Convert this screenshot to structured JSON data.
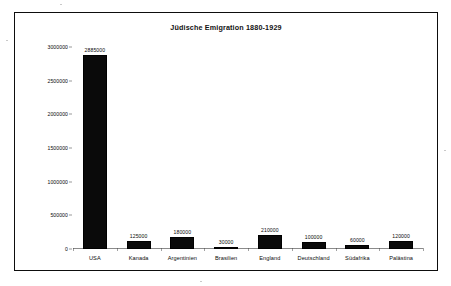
{
  "document": {
    "background_color": "#ffffff",
    "frame_color": "#0d0d0d"
  },
  "chart_data": {
    "type": "bar",
    "title": "Jüdische Emigration 1880-1929",
    "xlabel": "",
    "ylabel": "",
    "ylim": [
      0,
      3000000
    ],
    "grid": false,
    "legend": null,
    "bar_color": "#0a0a0a",
    "yticks": [
      0,
      500000,
      1000000,
      1500000,
      2000000,
      2500000,
      3000000
    ],
    "ytick_labels": [
      "0",
      "500000",
      "1000000",
      "1500000",
      "2000000",
      "2500000",
      "3000000"
    ],
    "categories": [
      "USA",
      "Kanada",
      "Argentinien",
      "Brasilien",
      "England",
      "Deutschland",
      "Südafrika",
      "Palästina"
    ],
    "values": [
      2885000,
      125000,
      180000,
      30000,
      210000,
      100000,
      60000,
      120000
    ],
    "value_labels": [
      "2885000",
      "125000",
      "180000",
      "30000",
      "210000",
      "100000",
      "60000",
      "120000"
    ]
  }
}
